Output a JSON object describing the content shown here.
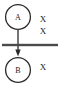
{
  "diagram": {
    "type": "petri-net",
    "background_color": "#ffffff",
    "stroke_color": "#2b2b2b",
    "text_color": "#1c1c1c",
    "places": [
      {
        "id": "place-a",
        "label": "A",
        "cx": 18,
        "cy": 17,
        "r": 12.5,
        "stroke_width": 1.3
      },
      {
        "id": "place-b",
        "label": "B",
        "cx": 18,
        "cy": 70,
        "r": 12.5,
        "stroke_width": 1.3
      }
    ],
    "transition": {
      "id": "transition-bar",
      "x1": 2,
      "x2": 58,
      "y": 45,
      "thickness": 2.4
    },
    "arc": {
      "id": "arc-a-to-b",
      "x": 18,
      "y1": 29.5,
      "y2": 55,
      "stroke_width": 1.3,
      "arrowhead_y": 55,
      "arrowhead_width": 5,
      "arrowhead_height": 6
    },
    "tokens": [
      {
        "id": "token-a-1",
        "label": "X",
        "x": 43,
        "y": 19
      },
      {
        "id": "token-a-2",
        "label": "X",
        "x": 43,
        "y": 31
      },
      {
        "id": "token-b-1",
        "label": "X",
        "x": 43,
        "y": 67
      }
    ]
  }
}
